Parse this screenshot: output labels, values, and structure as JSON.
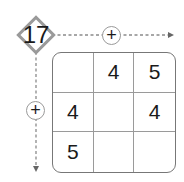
{
  "puzzle": {
    "target": "17",
    "row_operator": "+",
    "column_operator": "+",
    "grid": [
      [
        "",
        "4",
        "5"
      ],
      [
        "4",
        "",
        "4"
      ],
      [
        "5",
        "",
        ""
      ]
    ]
  },
  "colors": {
    "border": "#9a9a9a",
    "text": "#1a1a1a"
  }
}
